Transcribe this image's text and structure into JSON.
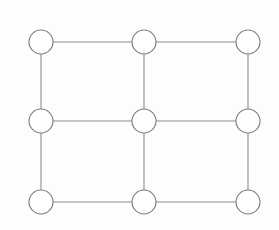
{
  "figure": {
    "type": "node-link-diagram",
    "width": 279,
    "height": 230,
    "background_color": "#fdfdfd"
  },
  "style": {
    "node_fill": "#ffffff",
    "node_stroke": "#7e7e7e",
    "node_radius": 12,
    "node_stroke_width": 1.1,
    "edge_stroke": "#8d8d8d",
    "edge_stroke_width": 1.1
  },
  "graph": {
    "node_count": 9,
    "edge_count": 12,
    "rows": 3,
    "columns": 3,
    "nodes": [
      {
        "id": "n00",
        "label": "",
        "row": 0,
        "col": 0,
        "cx": 41,
        "cy": 42,
        "r": 12,
        "degree": 2
      },
      {
        "id": "n01",
        "label": "",
        "row": 0,
        "col": 1,
        "cx": 144,
        "cy": 42,
        "r": 12,
        "degree": 3
      },
      {
        "id": "n02",
        "label": "",
        "row": 0,
        "col": 2,
        "cx": 248,
        "cy": 42,
        "r": 12,
        "degree": 2
      },
      {
        "id": "n10",
        "label": "",
        "row": 1,
        "col": 0,
        "cx": 41,
        "cy": 121,
        "r": 12,
        "degree": 3
      },
      {
        "id": "n11",
        "label": "",
        "row": 1,
        "col": 1,
        "cx": 144,
        "cy": 121,
        "r": 12,
        "degree": 4
      },
      {
        "id": "n12",
        "label": "",
        "row": 1,
        "col": 2,
        "cx": 248,
        "cy": 121,
        "r": 12,
        "degree": 3
      },
      {
        "id": "n20",
        "label": "",
        "row": 2,
        "col": 0,
        "cx": 41,
        "cy": 202,
        "r": 12,
        "degree": 2
      },
      {
        "id": "n21",
        "label": "",
        "row": 2,
        "col": 1,
        "cx": 144,
        "cy": 202,
        "r": 12,
        "degree": 3
      },
      {
        "id": "n22",
        "label": "",
        "row": 2,
        "col": 2,
        "cx": 248,
        "cy": 202,
        "r": 12,
        "degree": 2
      }
    ],
    "edges": [
      {
        "id": "e-n00-n01",
        "source": "n00",
        "target": "n01",
        "orientation": "horizontal",
        "x1": 53,
        "y1": 42,
        "x2": 132,
        "y2": 42
      },
      {
        "id": "e-n01-n02",
        "source": "n01",
        "target": "n02",
        "orientation": "horizontal",
        "x1": 156,
        "y1": 42,
        "x2": 236,
        "y2": 42
      },
      {
        "id": "e-n10-n11",
        "source": "n10",
        "target": "n11",
        "orientation": "horizontal",
        "x1": 53,
        "y1": 121,
        "x2": 132,
        "y2": 121
      },
      {
        "id": "e-n11-n12",
        "source": "n11",
        "target": "n12",
        "orientation": "horizontal",
        "x1": 156,
        "y1": 121,
        "x2": 236,
        "y2": 121
      },
      {
        "id": "e-n20-n21",
        "source": "n20",
        "target": "n21",
        "orientation": "horizontal",
        "x1": 53,
        "y1": 202,
        "x2": 132,
        "y2": 202
      },
      {
        "id": "e-n21-n22",
        "source": "n21",
        "target": "n22",
        "orientation": "horizontal",
        "x1": 156,
        "y1": 202,
        "x2": 236,
        "y2": 202
      },
      {
        "id": "e-n00-n10",
        "source": "n00",
        "target": "n10",
        "orientation": "vertical",
        "x1": 41,
        "y1": 54,
        "x2": 41,
        "y2": 109
      },
      {
        "id": "e-n01-n11",
        "source": "n01",
        "target": "n11",
        "orientation": "vertical",
        "x1": 144,
        "y1": 54,
        "x2": 144,
        "y2": 109
      },
      {
        "id": "e-n02-n12",
        "source": "n02",
        "target": "n12",
        "orientation": "vertical",
        "x1": 248,
        "y1": 54,
        "x2": 248,
        "y2": 109
      },
      {
        "id": "e-n10-n20",
        "source": "n10",
        "target": "n20",
        "orientation": "vertical",
        "x1": 41,
        "y1": 133,
        "x2": 41,
        "y2": 190
      },
      {
        "id": "e-n11-n21",
        "source": "n11",
        "target": "n21",
        "orientation": "vertical",
        "x1": 144,
        "y1": 133,
        "x2": 144,
        "y2": 190
      },
      {
        "id": "e-n12-n22",
        "source": "n12",
        "target": "n22",
        "orientation": "vertical",
        "x1": 248,
        "y1": 133,
        "x2": 248,
        "y2": 190
      }
    ]
  }
}
